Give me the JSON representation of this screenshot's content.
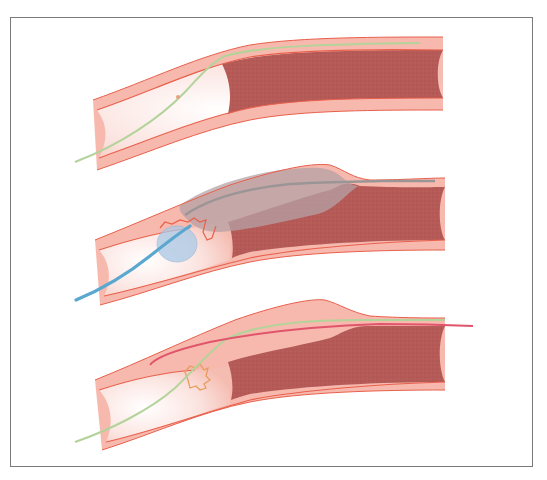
{
  "figure": {
    "description": "Three-panel illustration of a chronic total occlusion of a blood vessel treated with a subintimal approach",
    "colors": {
      "vessel_wall": "#f6b1a5",
      "wall_line": "#e8604c",
      "lumen_light": "#fbe3df",
      "occlusion": "#b55a57",
      "guidewire_green": "#b4d39a",
      "catheter_blue": "#5aa7cf",
      "balloon_blue": "#aac9e6",
      "dissection_gray": "#b6a2a6",
      "reentry_wire_red": "#e0556b",
      "frame": "#7a7a7a"
    },
    "panels": [
      {
        "id": 1,
        "label": "Guidewire entering subintimal space proximal to occlusion"
      },
      {
        "id": 2,
        "label": "Balloon catheter creating subintimal dissection alongside occlusion"
      },
      {
        "id": 3,
        "label": "Re-entry wire advanced through dissection plane past occlusion"
      }
    ]
  }
}
